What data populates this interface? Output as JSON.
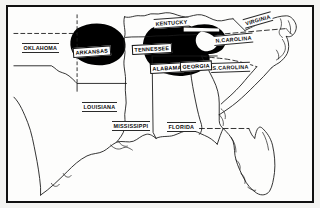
{
  "figure": {
    "kind": "thematic-distribution-map",
    "region": "Southeastern United States",
    "background_color": "#fdfdfc",
    "border_color": "#111111",
    "shade_color": "#000000",
    "outline_color": "#1a1a1a"
  },
  "legend": {
    "shaded_meaning": "shaded distribution area"
  },
  "labels": [
    {
      "id": "oklahoma",
      "text": "OKLAHOMA",
      "x": 14,
      "y": 38,
      "rotate": 0,
      "on_shade": false
    },
    {
      "id": "arkansas",
      "text": "ARKANSAS",
      "x": 68,
      "y": 43,
      "rotate": -4,
      "on_shade": true
    },
    {
      "id": "tennessee",
      "text": "TENNESSEE",
      "x": 128,
      "y": 40,
      "rotate": -3,
      "on_shade": true
    },
    {
      "id": "kentucky",
      "text": "KENTUCKY",
      "x": 148,
      "y": 14,
      "rotate": -4,
      "on_shade": false
    },
    {
      "id": "virginia",
      "text": "VIRGINIA",
      "x": 237,
      "y": 14,
      "rotate": -16,
      "on_shade": false
    },
    {
      "id": "n-carolina",
      "text": "N.CAROLINA",
      "x": 209,
      "y": 31,
      "rotate": -5,
      "on_shade": false
    },
    {
      "id": "s-carolina",
      "text": "S.CAROLINA",
      "x": 206,
      "y": 58,
      "rotate": -2,
      "on_shade": false
    },
    {
      "id": "alabama",
      "text": "ALABAMA",
      "x": 145,
      "y": 60,
      "rotate": -3,
      "on_shade": true
    },
    {
      "id": "georgia",
      "text": "GEORGIA",
      "x": 175,
      "y": 58,
      "rotate": -3,
      "on_shade": true
    },
    {
      "id": "mississippi",
      "text": "MISSISSIPPI",
      "x": 106,
      "y": 116,
      "rotate": 0,
      "on_shade": false
    },
    {
      "id": "louisiana",
      "text": "LOUISIANA",
      "x": 76,
      "y": 97,
      "rotate": 0,
      "on_shade": false
    },
    {
      "id": "florida",
      "text": "FLORIDA",
      "x": 161,
      "y": 117,
      "rotate": 0,
      "on_shade": false
    }
  ],
  "shaded_areas": [
    {
      "id": "arkansas-blob",
      "label": "ARKANSAS"
    },
    {
      "id": "tennessee-alabama-georgia-blob",
      "label": "TENNESSEE / ALABAMA / GEORGIA"
    }
  ]
}
